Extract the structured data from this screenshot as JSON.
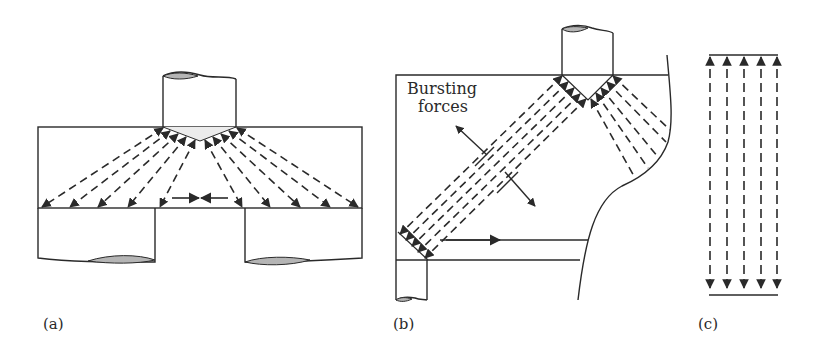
{
  "figure": {
    "panels": [
      {
        "id": "a",
        "label": "(a)"
      },
      {
        "id": "b",
        "label": "(b)",
        "annotation_line1": "Bursting",
        "annotation_line2": "forces"
      },
      {
        "id": "c",
        "label": "(c)"
      }
    ]
  },
  "colors": {
    "ink": "#2a2a2a",
    "hatch": "#b5b5b5",
    "background": "#ffffff"
  }
}
